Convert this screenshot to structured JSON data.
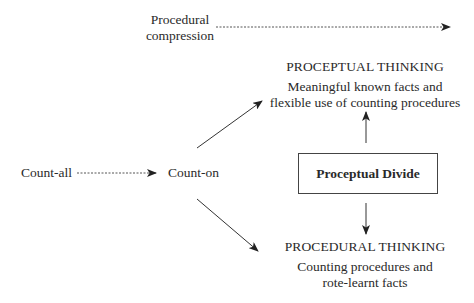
{
  "diagram": {
    "procedural_compression": {
      "line1": "Procedural",
      "line2": "compression"
    },
    "count_all": "Count-all",
    "count_on": "Count-on",
    "proceptual_divide": "Proceptual Divide",
    "proceptual_thinking": {
      "title": "PROCEPTUAL THINKING",
      "line1": "Meaningful known facts and",
      "line2": "flexible use of counting procedures"
    },
    "procedural_thinking": {
      "title": "PROCEDURAL THINKING",
      "line1": "Counting procedures and",
      "line2": "rote-learnt facts"
    },
    "colors": {
      "text": "#2a2a2a",
      "line": "#333333",
      "background": "#ffffff"
    }
  }
}
